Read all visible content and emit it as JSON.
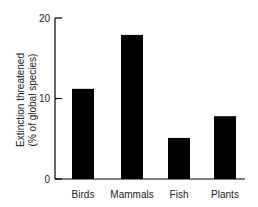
{
  "chart_data": {
    "type": "bar",
    "title": "",
    "categories": [
      "Birds",
      "Mammals",
      "Fish",
      "Plants"
    ],
    "values": [
      11.2,
      17.9,
      5.1,
      7.8
    ],
    "xlabel": "",
    "ylabel": "Extinction threatened (% of global species)",
    "ylabel_lines": [
      "Extinction threatened",
      "(% of global species)"
    ],
    "ylim": [
      0,
      20
    ],
    "yticks": [
      0,
      10,
      20
    ],
    "grid": false,
    "legend": null,
    "bar_color": "#000000"
  }
}
